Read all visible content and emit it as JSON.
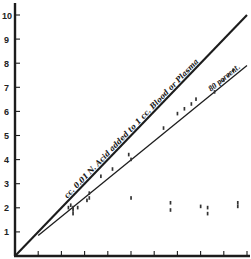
{
  "chart_data": {
    "type": "scatter",
    "title": "",
    "xlabel": "",
    "ylabel": "",
    "xlim": [
      0,
      10
    ],
    "ylim": [
      0,
      10
    ],
    "grid": false,
    "y_ticks": [
      1,
      2,
      3,
      4,
      5,
      6,
      7,
      8,
      9,
      10
    ],
    "y_tick_labels": [
      "1",
      "2",
      "3",
      "4",
      "5",
      "6",
      "7",
      "8",
      "9",
      "10"
    ],
    "x_ticks": [
      1,
      2,
      3,
      4,
      5,
      6,
      7,
      8,
      9,
      10
    ],
    "x_tick_labels": [],
    "lines": [
      {
        "name": "cc. 0.01 N Acid added to 1 cc. Blood or Plasma",
        "x": [
          0,
          10
        ],
        "y": [
          0,
          10
        ],
        "style": "thick"
      },
      {
        "name": "80 percent",
        "x": [
          1,
          10
        ],
        "y": [
          0.85,
          7.9
        ],
        "style": "thin"
      }
    ],
    "series": [
      {
        "name": "observations along 80 percent line",
        "points": [
          [
            2.3,
            2.0
          ],
          [
            2.4,
            2.1
          ],
          [
            2.5,
            1.9
          ],
          [
            2.7,
            2.0
          ],
          [
            3.1,
            2.3
          ],
          [
            3.2,
            2.6
          ],
          [
            3.7,
            3.3
          ],
          [
            4.2,
            3.6
          ],
          [
            4.9,
            4.2
          ],
          [
            5.0,
            4.0
          ],
          [
            6.4,
            5.3
          ],
          [
            7.0,
            5.9
          ],
          [
            7.3,
            6.1
          ],
          [
            7.6,
            6.3
          ],
          [
            7.8,
            6.5
          ],
          [
            8.6,
            6.8
          ],
          [
            9.0,
            7.3
          ],
          [
            9.2,
            7.5
          ],
          [
            9.4,
            7.7
          ]
        ]
      },
      {
        "name": "observations plateau near 2",
        "points": [
          [
            2.5,
            2.0
          ],
          [
            2.5,
            1.75
          ],
          [
            3.2,
            2.4
          ],
          [
            5.0,
            2.4
          ],
          [
            6.7,
            2.2
          ],
          [
            6.7,
            1.9
          ],
          [
            8.0,
            2.05
          ],
          [
            8.3,
            2.0
          ],
          [
            8.3,
            1.75
          ],
          [
            9.6,
            2.05
          ],
          [
            9.6,
            2.2
          ]
        ]
      }
    ],
    "annotations": [
      {
        "text": "cc. 0.01 N. Acid added to 1 cc. Blood or Plasma",
        "along": "thick line"
      },
      {
        "text": "80 percent.",
        "along": "thin line"
      }
    ]
  },
  "labels": {
    "main_line": "cc. 0.01 N. Acid added to 1 cc. Blood or Plasma",
    "percent_line": "80 percent."
  }
}
